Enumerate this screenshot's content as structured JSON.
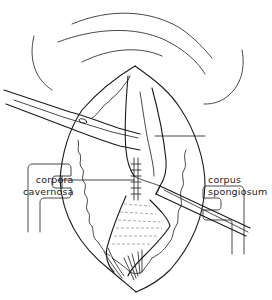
{
  "figure": {
    "type": "surgical line illustration",
    "background": "#ffffff",
    "stroke_color": "#1a1a1a",
    "labels": {
      "left": {
        "line1": "corpora",
        "line2": "cavernosa"
      },
      "right": {
        "line1": "corpus",
        "line2": "spongiosum"
      }
    },
    "elements": [
      "skin-fold-lines",
      "incision-opening",
      "left-retractor",
      "right-retractor",
      "upper-left-forceps",
      "lower-right-forceps",
      "corpus-spongiosum-tissue",
      "sutured-corpora",
      "leader-lines"
    ]
  }
}
